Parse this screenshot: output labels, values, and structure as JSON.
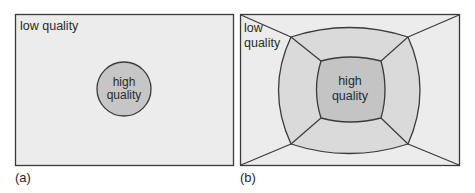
{
  "panels": {
    "a": {
      "caption": "(a)",
      "outer_label": "low quality",
      "inner_label_line1": "high",
      "inner_label_line2": "quality"
    },
    "b": {
      "caption": "(b)",
      "outer_label_line1": "low",
      "outer_label_line2": "quality",
      "inner_label_line1": "high",
      "inner_label_line2": "quality"
    }
  },
  "colors": {
    "background": "#ececec",
    "mid": "#d9d9d9",
    "inner": "#c4c4c4",
    "stroke": "#3a3a3a"
  }
}
